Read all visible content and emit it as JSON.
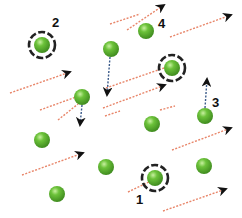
{
  "diagram": {
    "colors": {
      "particle": "#5db230",
      "particle_highlight": "#a8e07a",
      "drift_arrow": "#e8866a",
      "vertical_arrow": "#3b5b8a",
      "ring": "#222222",
      "arrowhead": "#111111"
    },
    "labels": [
      {
        "id": "label-1",
        "text": "1",
        "x": 136,
        "y": 204
      },
      {
        "id": "label-2",
        "text": "2",
        "x": 52,
        "y": 27
      },
      {
        "id": "label-3",
        "text": "3",
        "x": 212,
        "y": 107
      },
      {
        "id": "label-4",
        "text": "4",
        "x": 158,
        "y": 28
      }
    ],
    "particles": [
      {
        "x": 42,
        "y": 45,
        "ringed": true
      },
      {
        "x": 111,
        "y": 49,
        "ringed": false
      },
      {
        "x": 146,
        "y": 31,
        "ringed": false
      },
      {
        "x": 172,
        "y": 68,
        "ringed": true
      },
      {
        "x": 82,
        "y": 97,
        "ringed": false
      },
      {
        "x": 205,
        "y": 116,
        "ringed": false
      },
      {
        "x": 42,
        "y": 140,
        "ringed": false
      },
      {
        "x": 152,
        "y": 124,
        "ringed": false
      },
      {
        "x": 106,
        "y": 167,
        "ringed": false
      },
      {
        "x": 204,
        "y": 166,
        "ringed": false
      },
      {
        "x": 155,
        "y": 178,
        "ringed": true
      },
      {
        "x": 57,
        "y": 194,
        "ringed": false
      }
    ],
    "drift_arrows": [
      {
        "x1": 10,
        "y1": 93,
        "x2": 70,
        "y2": 72,
        "head": true
      },
      {
        "x1": 127,
        "y1": 30,
        "x2": 164,
        "y2": 5,
        "head": true
      },
      {
        "x1": 170,
        "y1": 37,
        "x2": 231,
        "y2": 15,
        "head": true
      },
      {
        "x1": 106,
        "y1": 88,
        "x2": 164,
        "y2": 68,
        "head": false
      },
      {
        "x1": 103,
        "y1": 108,
        "x2": 165,
        "y2": 85,
        "head": true
      },
      {
        "x1": 58,
        "y1": 120,
        "x2": 78,
        "y2": 104,
        "head": false
      },
      {
        "x1": 22,
        "y1": 175,
        "x2": 83,
        "y2": 153,
        "head": true
      },
      {
        "x1": 105,
        "y1": 116,
        "x2": 120,
        "y2": 111,
        "head": false
      },
      {
        "x1": 128,
        "y1": 192,
        "x2": 149,
        "y2": 182,
        "head": false
      },
      {
        "x1": 172,
        "y1": 150,
        "x2": 231,
        "y2": 128,
        "head": true
      },
      {
        "x1": 163,
        "y1": 211,
        "x2": 226,
        "y2": 189,
        "head": true
      },
      {
        "x1": 0,
        "y1": 218,
        "x2": 0,
        "y2": 218,
        "head": false
      },
      {
        "x1": 40,
        "y1": 110,
        "x2": 76,
        "y2": 97,
        "head": false
      },
      {
        "x1": 160,
        "y1": 110,
        "x2": 175,
        "y2": 106,
        "head": false
      },
      {
        "x1": 110,
        "y1": 24,
        "x2": 140,
        "y2": 14,
        "head": false
      }
    ],
    "vertical_arrows": [
      {
        "x1": 110,
        "y1": 57,
        "x2": 107,
        "y2": 95
      },
      {
        "x1": 82,
        "y1": 105,
        "x2": 80,
        "y2": 125
      },
      {
        "x1": 205,
        "y1": 108,
        "x2": 207,
        "y2": 79
      }
    ]
  }
}
